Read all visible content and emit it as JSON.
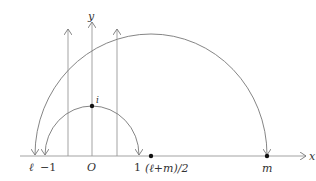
{
  "diagram": {
    "axes": {
      "x_label": "x",
      "y_label": "y"
    },
    "points": [
      {
        "id": "ell",
        "label": "ℓ",
        "x_value": "ℓ"
      },
      {
        "id": "minus-one",
        "label": "−1",
        "x_value": -1
      },
      {
        "id": "origin",
        "label": "O",
        "x_value": 0
      },
      {
        "id": "one",
        "label": "1",
        "x_value": 1
      },
      {
        "id": "midpoint",
        "label": "(ℓ+m)/2",
        "x_value": "(ℓ+m)/2",
        "marked": true
      },
      {
        "id": "m",
        "label": "m",
        "x_value": "m",
        "marked": true
      },
      {
        "id": "i",
        "label": "i",
        "marked": true
      }
    ],
    "geodesics": [
      {
        "id": "small-semicircle",
        "from": "−1",
        "to": "1",
        "center": "O",
        "passes_through": "i"
      },
      {
        "id": "large-semicircle",
        "from": "ℓ",
        "to": "m",
        "center": "(ℓ+m)/2"
      }
    ],
    "vertical_rays": 3
  }
}
